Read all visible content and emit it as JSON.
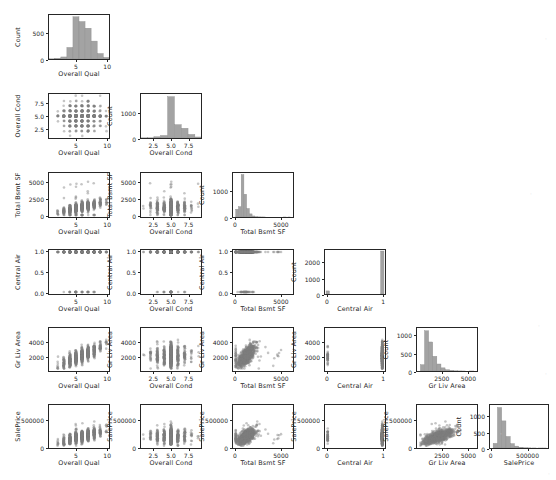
{
  "figure": {
    "kind": "pairgrid-lower-triangle",
    "library_look": "seaborn PairGrid",
    "background": "#ffffff",
    "axis_color": "#262626",
    "marker_color": "#7f7f7f",
    "hist_color": "#a3a3a3",
    "hist_edge_color": "#8c8c8c"
  },
  "variables": [
    {
      "key": "overall_qual",
      "label": "Overall Qual",
      "min": 1,
      "max": 10,
      "xticks": [
        "5",
        "10"
      ],
      "xtickvals": [
        5,
        10
      ],
      "yticks": [
        "5",
        "10"
      ],
      "ytickvals": [
        5,
        10
      ]
    },
    {
      "key": "overall_cond",
      "label": "Overall Cond",
      "min": 1,
      "max": 9,
      "xticks": [
        "2.5",
        "5.0",
        "7.5"
      ],
      "xtickvals": [
        2.5,
        5.0,
        7.5
      ],
      "yticks": [
        "2.5",
        "5.0",
        "7.5"
      ],
      "ytickvals": [
        2.5,
        5.0,
        7.5
      ]
    },
    {
      "key": "total_bsmt_sf",
      "label": "Total Bsmt SF",
      "min": 0,
      "max": 6110,
      "xticks": [
        "0",
        "5000"
      ],
      "xtickvals": [
        0,
        5000
      ],
      "yticks": [
        "0",
        "2500",
        "5000"
      ],
      "ytickvals": [
        0,
        2500,
        5000
      ]
    },
    {
      "key": "central_air",
      "label": "Central Air",
      "min": 0,
      "max": 1,
      "xticks": [
        "0",
        "1"
      ],
      "xtickvals": [
        0,
        1
      ],
      "yticks": [
        "0.0",
        "0.5",
        "1.0"
      ],
      "ytickvals": [
        0,
        0.5,
        1
      ]
    },
    {
      "key": "gr_liv_area",
      "label": "Gr Liv Area",
      "min": 334,
      "max": 5642,
      "xticks": [
        "2500",
        "5000"
      ],
      "xtickvals": [
        2500,
        5000
      ],
      "yticks": [
        "2000",
        "4000"
      ],
      "ytickvals": [
        2000,
        4000
      ]
    },
    {
      "key": "sale_price",
      "label": "SalePrice",
      "min": 12789,
      "max": 755000,
      "xticks": [
        "0",
        "500000"
      ],
      "xtickvals": [
        0,
        500000
      ],
      "yticks": [
        "0",
        "500000"
      ],
      "ytickvals": [
        0,
        500000
      ]
    }
  ],
  "count_axis_label": "Count",
  "chart_data": {
    "type": "scatter",
    "title": "",
    "xlabel": "",
    "ylabel": "",
    "grid": false,
    "legend": null,
    "layout": "6x6 lower-triangle pair plot; diagonal = histogram (Count), off-diagonal = scatter",
    "n_points_approx": 2930,
    "diagonal_histograms": [
      {
        "variable": "overall_qual",
        "xlabel": "Overall Qual",
        "ylabel": "Count",
        "xlim": [
          0.55,
          10.45
        ],
        "ylim": [
          0,
          860
        ],
        "yticks": [
          0,
          500
        ],
        "bin_centers": [
          1,
          2,
          3,
          4,
          5,
          6,
          7,
          8,
          9,
          10
        ],
        "counts": [
          4,
          13,
          40,
          226,
          825,
          732,
          602,
          350,
          107,
          31
        ]
      },
      {
        "variable": "overall_cond",
        "xlabel": "Overall Cond",
        "ylabel": "Count",
        "xlim": [
          0.6,
          9.4
        ],
        "ylim": [
          0,
          1760
        ],
        "yticks": [
          0,
          1000
        ],
        "bin_centers": [
          1,
          2,
          3,
          4,
          5,
          6,
          7,
          8,
          9
        ],
        "counts": [
          7,
          10,
          50,
          101,
          1654,
          533,
          390,
          144,
          41
        ]
      },
      {
        "variable": "total_bsmt_sf",
        "xlabel": "Total Bsmt SF",
        "ylabel": "Count",
        "xlim": [
          -305,
          6415
        ],
        "ylim": [
          0,
          1700
        ],
        "yticks": [
          0,
          1000
        ],
        "bin_centers": [
          153,
          458,
          764,
          1069,
          1375,
          1680,
          1986,
          2291,
          2597,
          2902,
          3208,
          5500,
          6000
        ],
        "counts": [
          300,
          400,
          1640,
          880,
          330,
          120,
          40,
          14,
          6,
          3,
          2,
          1,
          1
        ]
      },
      {
        "variable": "central_air",
        "xlabel": "Central Air",
        "ylabel": "Count",
        "xlim": [
          -0.05,
          1.05
        ],
        "ylim": [
          0,
          2800
        ],
        "yticks": [
          0,
          1000,
          2000
        ],
        "bin_centers": [
          0,
          1
        ],
        "counts": [
          196,
          2734
        ]
      },
      {
        "variable": "gr_liv_area",
        "xlabel": "Gr Liv Area",
        "ylabel": "Count",
        "xlim": [
          70,
          5906
        ],
        "ylim": [
          0,
          1230
        ],
        "yticks": [
          0,
          500,
          1000
        ],
        "bin_centers": [
          600,
          1000,
          1400,
          1800,
          2200,
          2600,
          3000,
          3400,
          3800,
          4200,
          4600,
          5400
        ],
        "counts": [
          180,
          1150,
          830,
          420,
          200,
          90,
          35,
          14,
          6,
          3,
          1,
          1
        ]
      },
      {
        "variable": "sale_price",
        "xlabel": "SalePrice",
        "ylabel": "Count",
        "xlim": [
          -24321,
          792110
        ],
        "ylim": [
          0,
          1380
        ],
        "yticks": [
          0,
          500,
          1000
        ],
        "bin_centers": [
          50000,
          110000,
          170000,
          230000,
          290000,
          350000,
          410000,
          470000,
          530000,
          600000,
          680000,
          745000
        ],
        "counts": [
          150,
          1300,
          870,
          370,
          140,
          60,
          25,
          10,
          5,
          2,
          1,
          1
        ]
      }
    ],
    "scatter_pairs": [
      {
        "x": "overall_cond",
        "y": "overall_qual",
        "relationship": "discrete integer lattice, dense 3-8 cond vs 4-8 qual"
      },
      {
        "x": "total_bsmt_sf",
        "y": "overall_qual",
        "relationship": "positive, qual rises with bsmt sf; two far outliers ~5000-6100"
      },
      {
        "x": "total_bsmt_sf",
        "y": "overall_cond",
        "relationship": "horizontal bands at integer cond; outliers near 5000-6100"
      },
      {
        "x": "central_air",
        "y": "overall_qual",
        "relationship": "two vertical strips at 0 and 1"
      },
      {
        "x": "central_air",
        "y": "overall_cond",
        "relationship": "two vertical strips at 0 and 1"
      },
      {
        "x": "central_air",
        "y": "total_bsmt_sf",
        "relationship": "two vertical strips; taller spread at 1"
      },
      {
        "x": "gr_liv_area",
        "y": "overall_qual",
        "relationship": "positive wedge"
      },
      {
        "x": "gr_liv_area",
        "y": "overall_cond",
        "relationship": "horizontal integer bands"
      },
      {
        "x": "gr_liv_area",
        "y": "total_bsmt_sf",
        "relationship": "strong positive, cone-shaped; outliers upper-right"
      },
      {
        "x": "gr_liv_area",
        "y": "central_air",
        "relationship": "two horizontal strips at 0.0 and 1.0"
      },
      {
        "x": "sale_price",
        "y": "overall_qual",
        "relationship": "strong positive, saturating near qual 10"
      },
      {
        "x": "sale_price",
        "y": "overall_cond",
        "relationship": "horizontal integer bands, widest at cond 5"
      },
      {
        "x": "sale_price",
        "y": "total_bsmt_sf",
        "relationship": "positive, fan out; outliers ~5000-6100 bsmt"
      },
      {
        "x": "sale_price",
        "y": "central_air",
        "relationship": "two horizontal strips at 0.0 and 1.0"
      },
      {
        "x": "sale_price",
        "y": "gr_liv_area",
        "relationship": "strong positive linear with scatter"
      },
      {
        "x": "overall_qual",
        "y": "overall_qual",
        "relationship": "diagonal histogram"
      }
    ]
  }
}
